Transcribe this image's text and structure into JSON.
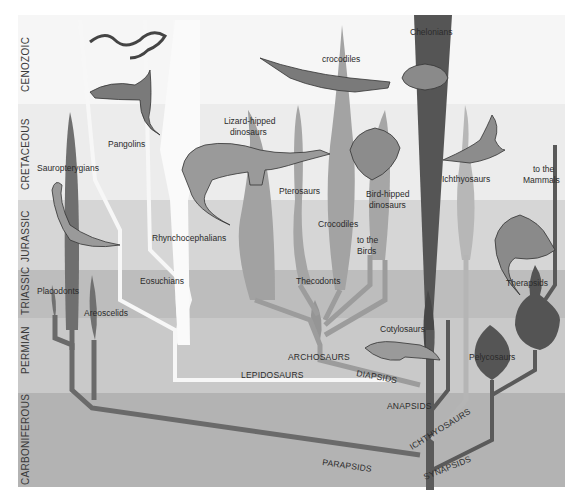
{
  "periods": [
    {
      "name": "CENOZOIC",
      "y0": 15,
      "y1": 104,
      "color": "#f6f6f6"
    },
    {
      "name": "CRETACEOUS",
      "y0": 104,
      "y1": 200,
      "color": "#ececec"
    },
    {
      "name": "JURASSIC",
      "y0": 200,
      "y1": 270,
      "color": "#d9d9d9"
    },
    {
      "name": "TRIASSIC",
      "y0": 270,
      "y1": 318,
      "color": "#bfbfbf"
    },
    {
      "name": "PERMIAN",
      "y0": 318,
      "y1": 393,
      "color": "#cbcbcb"
    },
    {
      "name": "CARBONIFEROUS",
      "y0": 393,
      "y1": 487,
      "color": "#b5b5b5"
    }
  ],
  "taxa": {
    "pangolins": "Pangolins",
    "crocodiles_modern": "crocodiles",
    "chelonians": "Chelonians",
    "sauropterygians": "Sauropterygians",
    "lizard_hipped_1": "Lizard-hipped",
    "lizard_hipped_2": "dinosaurs",
    "pterosaurs": "Pterosaurs",
    "bird_hipped_1": "Bird-hipped",
    "bird_hipped_2": "dinosaurs",
    "ichthyosaurs": "Ichthyosaurs",
    "to_mammals_1": "to the",
    "to_mammals_2": "Mammals",
    "rhynchocephalians": "Rhynchocephalians",
    "crocodiles": "Crocodiles",
    "to_birds_1": "to the",
    "to_birds_2": "Birds",
    "eosuchians": "Eosuchians",
    "thecodonts": "Thecodonts",
    "therapsids": "Therapsids",
    "placodonts": "Placodonts",
    "areoscelids": "Areoscelids",
    "cotylosaurs": "Cotylosaurs",
    "pelycosaurs": "Pelycosaurs"
  },
  "clades": {
    "archosaurs": "ARCHOSAURS",
    "lepidosaurs": "LEPIDOSAURS",
    "diapsids": "DIAPSIDS",
    "anapsids": "ANAPSIDS",
    "ichthyosaurs": "ICHTHYOSAURS",
    "parapsids": "PARAPSIDS",
    "synapsids": "SYNAPSIDS"
  },
  "illustrations": [
    "snake",
    "lizard",
    "crocodile",
    "turtle",
    "sauropod",
    "triceratops",
    "ichthyosaur",
    "plesiosaur",
    "dimetrodon",
    "cotylosaur"
  ],
  "colors": {
    "dark_branch": "#5e5e5e",
    "mid_branch": "#8c8c8c",
    "light_branch": "#a9a9a9",
    "white_branch": "#f7f7f7",
    "dark_trunk": "#4a4a4a"
  }
}
